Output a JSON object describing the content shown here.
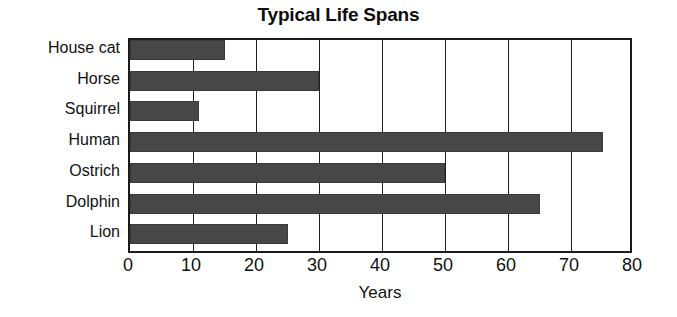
{
  "chart_data": {
    "type": "bar",
    "orientation": "horizontal",
    "title": "Typical Life Spans",
    "xlabel": "Years",
    "ylabel": "",
    "categories": [
      "House cat",
      "Horse",
      "Squirrel",
      "Human",
      "Ostrich",
      "Dolphin",
      "Lion"
    ],
    "values": [
      15,
      30,
      11,
      75,
      50,
      65,
      25
    ],
    "xlim": [
      0,
      80
    ],
    "xticks": [
      0,
      10,
      20,
      30,
      40,
      50,
      60,
      70,
      80
    ],
    "xtick_labels": [
      "0",
      "10",
      "20",
      "30",
      "40",
      "50",
      "60",
      "70",
      "80"
    ],
    "grid": "vertical",
    "legend": "none",
    "bar_color": "#474747",
    "axis_color": "#1a1a1a",
    "background": "#ffffff"
  }
}
